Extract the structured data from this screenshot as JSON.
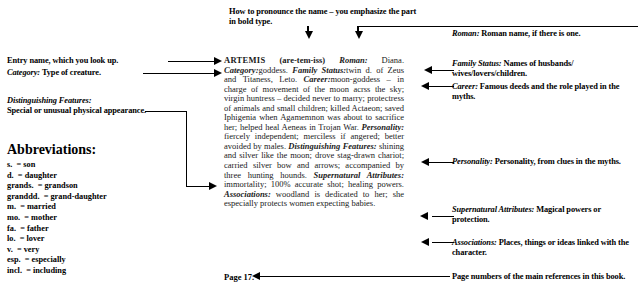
{
  "annotations": {
    "pronounce": "How to pronounce the name – you emphasize the part in bold type.",
    "entry_name": "Entry name, which you look up.",
    "category_label": "Category:",
    "category_text": " Type of creature.",
    "distinguishing_label": "Distinguishing Features:",
    "distinguishing_text": "Special or unusual physical appearance.",
    "roman_label": "Roman:",
    "roman_text": " Roman name, if there is one.",
    "family_label": "Family Status:",
    "family_text": " Names of husbands/ wives/lovers/children.",
    "career_label": "Career:",
    "career_text": " Famous deeds and the role played in the myths.",
    "personality_label": "Personality:",
    "personality_text": " Personality, from clues in the myths.",
    "supernatural_label": "Supernatural Attributes:",
    "supernatural_text": " Magical powers or protection.",
    "associations_label": "Associations:",
    "associations_text": " Places, things or ideas linked with the character.",
    "pagenum_note": "Page numbers of the main references in this book."
  },
  "abbreviations": {
    "title": "Abbreviations:",
    "items": [
      "s.  = son",
      "d.  = daughter",
      "grands.  = grandson",
      "granddd.  = grand-daughter",
      "m.  = married",
      "mo.  = mother",
      "fa.  = father",
      "lo.  = lover",
      "v.  = very",
      "esp.  = especially",
      "incl.  = including"
    ]
  },
  "entry": {
    "headword": "ARTEMIS",
    "pronunciation": "(are-tem-iss)",
    "roman_label": "Roman:",
    "roman_value": " Diana.",
    "category_label": "Category:",
    "category_value": "goddess.",
    "family_label": "Family Status:",
    "family_value": "twin d. of Zeus and Titaness, Leto.",
    "career_label": "Career:",
    "career_value": "moon-goddess – in charge of movement of the moon acrss the sky; virgin huntress – decided never to marry; protectress of animals and small children; killed Actaeon; saved Iphigenia when Agamemnon was about to sacrifice her; helped heal Aeneas in Trojan War.",
    "personality_label": "Personality:",
    "personality_value": " fiercely independent; merciless if angered; better avoided by males.",
    "distinguishing_label": "Distinguishing Features:",
    "distinguishing_value": " shining and silver like the moon; drove stag-drawn chariot; carried silver bow and arrows; accompanied by three hunting hounds.",
    "supernatural_label": "Supernatural Attributes:",
    "supernatural_value": " immortality; 100% accurate shot; healing powers.",
    "associations_label": "Associations:",
    "associations_value": " woodland is dedicated to her; she especially protects women expecting babies.",
    "page": "Page 17."
  }
}
